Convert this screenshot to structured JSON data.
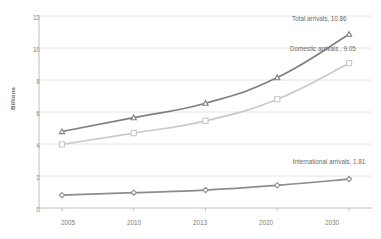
{
  "chart_data": {
    "type": "line",
    "title": "",
    "xlabel": "",
    "ylabel": "Billions",
    "categories": [
      "2005",
      "2010",
      "2013",
      "2020",
      "2030"
    ],
    "ylim": [
      0,
      12
    ],
    "yticks": [
      "0",
      "2",
      "4",
      "6",
      "8",
      "10",
      "12"
    ],
    "grid": true,
    "legend_position": "inline-annotations",
    "series": [
      {
        "name": "Total arrivals",
        "values": [
          4.78,
          5.65,
          6.55,
          8.15,
          10.86
        ],
        "color": "#7f7f7f",
        "marker": "triangle"
      },
      {
        "name": "Domestic arrivals",
        "values": [
          3.97,
          4.68,
          5.45,
          6.8,
          9.05
        ],
        "color": "#c9c9c9",
        "marker": "square"
      },
      {
        "name": "International arrivals",
        "values": [
          0.8,
          0.96,
          1.12,
          1.42,
          1.81
        ],
        "color": "#8c8c8c",
        "marker": "diamond"
      }
    ],
    "annotations": [
      {
        "text": "Total arrivals, 10.86",
        "series": "Total arrivals"
      },
      {
        "text": "Domestic arrivals , 9.05",
        "series": "Domestic arrivals"
      },
      {
        "text": "International arrivals, 1.81",
        "series": "International arrivals"
      }
    ]
  },
  "colors": {
    "gridline": "#e4e4e4",
    "axis": "#bfbfbf",
    "tick_text": "#808080",
    "annotation_text": "#6a6a6a"
  }
}
